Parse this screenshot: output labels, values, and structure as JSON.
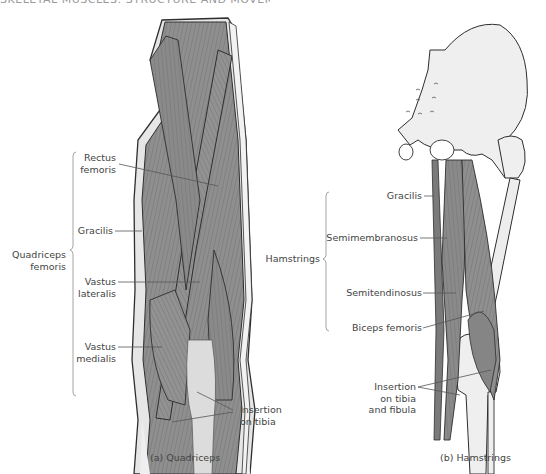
{
  "figure": {
    "title_cut": "SKELETAL MUSCLES: STRUCTURE AND MOVEMENT"
  },
  "panel_a": {
    "caption": "(a) Quadriceps",
    "group_label_line1": "Quadriceps",
    "group_label_line2": "femoris",
    "labels": {
      "rectus_femoris_1": "Rectus",
      "rectus_femoris_2": "femoris",
      "gracilis": "Gracilis",
      "vastus_lateralis_1": "Vastus",
      "vastus_lateralis_2": "lateralis",
      "vastus_medialis_1": "Vastus",
      "vastus_medialis_2": "medialis",
      "insertion_1": "Insertion",
      "insertion_2": "on tibia"
    }
  },
  "panel_b": {
    "caption": "(b) Hamstrings",
    "group_label": "Hamstrings",
    "labels": {
      "gracilis": "Gracilis",
      "semimembranosus": "Semimembranosus",
      "semitendinosus": "Semitendinosus",
      "biceps_femoris": "Biceps femoris",
      "insertion_1": "Insertion",
      "insertion_2": "on tibia",
      "insertion_3": "and fibula"
    }
  },
  "colors": {
    "muscle": "#8e8e8e",
    "muscle_dark": "#6f6f6f",
    "bone": "#efefef",
    "outline": "#2e2e2e",
    "leader": "#555555",
    "bracket": "#9a9a9a"
  }
}
